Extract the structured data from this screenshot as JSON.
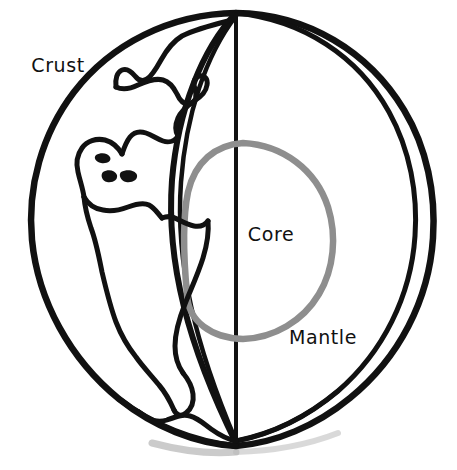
{
  "diagram": {
    "background_color": "#ffffff",
    "line_color": "#111111",
    "core_line_color": "#8e8e8e",
    "shadow_color": "#b9b9b9",
    "labels": [
      {
        "id": "crust",
        "text": "Crust",
        "x": 58,
        "y": 66,
        "anchor": "middle"
      },
      {
        "id": "core",
        "text": "Core",
        "x": 271,
        "y": 235,
        "anchor": "middle"
      },
      {
        "id": "mantle",
        "text": "Mantle",
        "x": 323,
        "y": 338,
        "anchor": "middle"
      }
    ],
    "layers": [
      {
        "id": "crust",
        "name": "Crust",
        "description": "Outer shell of the Earth, shown with continent outlines"
      },
      {
        "id": "mantle",
        "name": "Mantle",
        "description": "Middle layer between crust and core"
      },
      {
        "id": "core",
        "name": "Core",
        "description": "Innermost layer, drawn as a gray circle"
      }
    ],
    "icons": {
      "globe": "globe-icon",
      "cutaway_wedge": "cutaway-wedge-icon"
    }
  }
}
